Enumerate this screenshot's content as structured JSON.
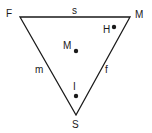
{
  "diagram": {
    "vertices": {
      "top_left": {
        "label": "F",
        "x": 20,
        "y": 17
      },
      "top_right": {
        "label": "M",
        "x": 130,
        "y": 17
      },
      "bottom": {
        "label": "S",
        "x": 76,
        "y": 115
      }
    },
    "edges": {
      "top": {
        "label": "s"
      },
      "left": {
        "label": "m"
      },
      "right": {
        "label": "f"
      }
    },
    "points": [
      {
        "label": "H",
        "x": 114,
        "y": 27
      },
      {
        "label": "M",
        "x": 76,
        "y": 51
      },
      {
        "label": "I",
        "x": 76,
        "y": 96
      }
    ],
    "colors": {
      "line": "#1a1a1a",
      "background": "#ffffff"
    }
  }
}
